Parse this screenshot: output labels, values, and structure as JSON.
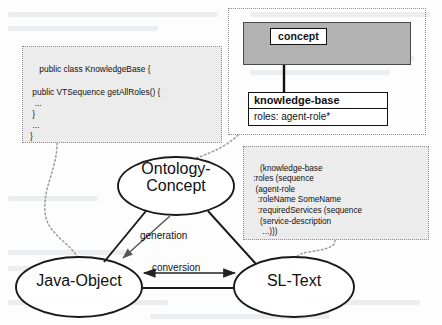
{
  "diagram": {
    "colors": {
      "package_fill": "#b2b2b2",
      "code_fill": "#ececec",
      "stroke": "#111111",
      "dotted_stroke": "#8d8d8d"
    }
  },
  "java_code_box": {
    "name": "java-source-snippet",
    "text": "public class KnowledgeBase {\n\n public VTSequence getAllRoles() {\n  ...\n }\n ...\n}"
  },
  "uml": {
    "package_label": "concept",
    "class_name": "knowledge-base",
    "class_attribute": "roles: agent-role*",
    "generalization": "inheritance-triangle"
  },
  "sl_code_box": {
    "name": "sl-text-snippet",
    "text": "(knowledge-base\n :roles (sequence\n  (agent-role\n   :roleName SomeName\n   :requiredServices (sequence\n    (service-description\n     ...)))"
  },
  "nodes": {
    "ontology": "Ontology-\nConcept",
    "java": "Java-Object",
    "sl": "SL-Text"
  },
  "edges": {
    "generation": "generation",
    "conversion": "conversion"
  }
}
